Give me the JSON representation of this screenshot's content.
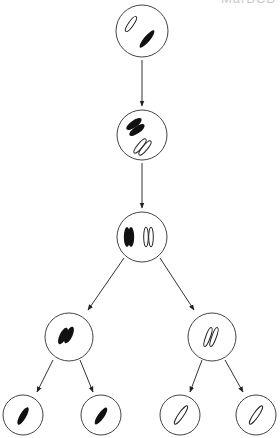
{
  "diagram": {
    "type": "meiosis",
    "clipped_header_text": "MarBCB",
    "colors": {
      "stroke": "#3a3a3a",
      "maternal": "#111111",
      "paternal": "#ffffff"
    },
    "cells": [
      {
        "id": "parent-cell",
        "stage": "diploid",
        "cx": 142,
        "cy": 31,
        "r": 26
      },
      {
        "id": "replicated-cell",
        "stage": "chromosomes replicated",
        "cx": 142,
        "cy": 135,
        "r": 25
      },
      {
        "id": "paired-cell",
        "stage": "homologs paired",
        "cx": 142,
        "cy": 237,
        "r": 25
      },
      {
        "id": "meiosis1-left-cell",
        "stage": "after meiosis I",
        "cx": 69,
        "cy": 337,
        "r": 24
      },
      {
        "id": "meiosis1-right-cell",
        "stage": "after meiosis I",
        "cx": 212,
        "cy": 337,
        "r": 24
      },
      {
        "id": "gamete-1",
        "stage": "gamete",
        "cx": 23,
        "cy": 415,
        "r": 20
      },
      {
        "id": "gamete-2",
        "stage": "gamete",
        "cx": 101,
        "cy": 415,
        "r": 20
      },
      {
        "id": "gamete-3",
        "stage": "gamete",
        "cx": 180,
        "cy": 415,
        "r": 20
      },
      {
        "id": "gamete-4",
        "stage": "gamete",
        "cx": 256,
        "cy": 415,
        "r": 20
      }
    ],
    "arrows": [
      {
        "from": "parent-cell",
        "to": "replicated-cell"
      },
      {
        "from": "replicated-cell",
        "to": "paired-cell"
      },
      {
        "from": "paired-cell",
        "to": "meiosis1-left-cell"
      },
      {
        "from": "paired-cell",
        "to": "meiosis1-right-cell"
      },
      {
        "from": "meiosis1-left-cell",
        "to": "gamete-1"
      },
      {
        "from": "meiosis1-left-cell",
        "to": "gamete-2"
      },
      {
        "from": "meiosis1-right-cell",
        "to": "gamete-3"
      },
      {
        "from": "meiosis1-right-cell",
        "to": "gamete-4"
      }
    ]
  }
}
